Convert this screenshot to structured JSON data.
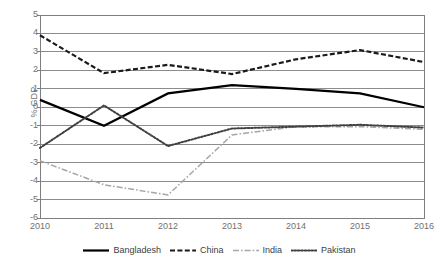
{
  "chart_data": {
    "type": "line",
    "title": "",
    "xlabel": "",
    "ylabel": "% GDP",
    "x": [
      2010,
      2011,
      2012,
      2013,
      2014,
      2015,
      2016
    ],
    "categories": [
      "2010",
      "2011",
      "2012",
      "2013",
      "2014",
      "2015",
      "2016"
    ],
    "xtick_labels": [
      "2010",
      "2011",
      "2012",
      "2013",
      "2014",
      "2015",
      "2016"
    ],
    "ytick_labels": [
      "5",
      "4",
      "3",
      "2",
      "1",
      "0",
      "-1",
      "-2",
      "-3",
      "-4",
      "-5",
      "-6"
    ],
    "ylim": [
      -6,
      5
    ],
    "ytick_step": 1,
    "grid": "horizontal",
    "legend_position": "bottom",
    "series": [
      {
        "name": "Bangladesh",
        "style": "solid",
        "color": "#000000",
        "values": [
          0.4,
          -1.0,
          0.75,
          1.2,
          1.0,
          0.75,
          0.0
        ]
      },
      {
        "name": "China",
        "style": "dashed",
        "color": "#1a1a1a",
        "values": [
          3.9,
          1.85,
          2.3,
          1.8,
          2.6,
          3.1,
          2.45
        ]
      },
      {
        "name": "India",
        "style": "dash-dot",
        "color": "#a6a6a6",
        "values": [
          -2.9,
          -4.2,
          -4.75,
          -1.5,
          -1.05,
          -1.05,
          -1.2
        ]
      },
      {
        "name": "Pakistan",
        "style": "dotted",
        "color": "#404040",
        "values": [
          -2.2,
          0.1,
          -2.1,
          -1.15,
          -1.05,
          -0.95,
          -1.1
        ]
      }
    ]
  },
  "axis": {
    "y_title": "% GDP"
  },
  "legend": {
    "items": [
      {
        "label": "Bangladesh"
      },
      {
        "label": "China"
      },
      {
        "label": "India"
      },
      {
        "label": "Pakistan"
      }
    ]
  },
  "colors": {
    "plot_border": "#7f7f7f",
    "gridline": "#808080",
    "background": "#ffffff",
    "tick_text": "#6f6f6f"
  }
}
